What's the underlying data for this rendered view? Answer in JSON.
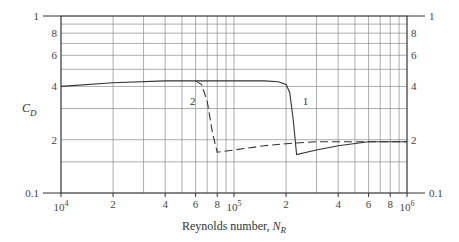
{
  "chart_data": {
    "type": "line",
    "title": "",
    "xlabel": "Reynolds number, N_R",
    "xlabel_main": "Reynolds number, ",
    "xlabel_symbol": "N",
    "xlabel_sub": "R",
    "ylabel": "C_D",
    "ylabel_symbol": "C",
    "ylabel_sub": "D",
    "xscale": "log",
    "yscale": "log",
    "xlim": [
      10000,
      1000000
    ],
    "ylim": [
      0.1,
      1
    ],
    "grid": true,
    "x_ticks": [
      {
        "value": 10000,
        "label": "10",
        "exp": "4"
      },
      {
        "value": 20000,
        "label": "2"
      },
      {
        "value": 40000,
        "label": "4"
      },
      {
        "value": 60000,
        "label": "6"
      },
      {
        "value": 80000,
        "label": "8"
      },
      {
        "value": 100000,
        "label": "10",
        "exp": "5"
      },
      {
        "value": 200000,
        "label": "2"
      },
      {
        "value": 400000,
        "label": "4"
      },
      {
        "value": 600000,
        "label": "6"
      },
      {
        "value": 800000,
        "label": "8"
      },
      {
        "value": 1000000,
        "label": "10",
        "exp": "6"
      }
    ],
    "x_grid_minor": [
      30000,
      50000,
      70000,
      90000,
      300000,
      500000,
      700000,
      900000
    ],
    "y_ticks": [
      {
        "value": 1,
        "label": "1"
      },
      {
        "value": 0.8,
        "label": "8"
      },
      {
        "value": 0.6,
        "label": "6"
      },
      {
        "value": 0.4,
        "label": "4"
      },
      {
        "value": 0.2,
        "label": "2"
      },
      {
        "value": 0.1,
        "label": "0.1"
      }
    ],
    "y_grid": [
      1,
      0.9,
      0.8,
      0.7,
      0.6,
      0.5,
      0.4,
      0.3,
      0.2,
      0.15,
      0.1
    ],
    "series": [
      {
        "name": "1",
        "style": "solid",
        "x": [
          10000,
          20000,
          40000,
          60000,
          100000,
          150000,
          180000,
          200000,
          210000,
          220000,
          230000,
          300000,
          400000,
          600000,
          800000,
          1000000
        ],
        "y": [
          0.4,
          0.42,
          0.43,
          0.43,
          0.43,
          0.43,
          0.425,
          0.41,
          0.37,
          0.26,
          0.165,
          0.175,
          0.185,
          0.195,
          0.195,
          0.195
        ]
      },
      {
        "name": "2",
        "style": "dashed",
        "x": [
          60000,
          65000,
          70000,
          75000,
          80000,
          100000,
          150000,
          200000,
          300000,
          400000,
          600000,
          800000,
          1000000
        ],
        "y": [
          0.43,
          0.41,
          0.33,
          0.22,
          0.17,
          0.175,
          0.185,
          0.19,
          0.195,
          0.195,
          0.195,
          0.195,
          0.195
        ]
      }
    ],
    "annotations": [
      {
        "text": "1",
        "near_x": 240000,
        "near_y": 0.33
      },
      {
        "text": "2",
        "near_x": 62000,
        "near_y": 0.33
      }
    ]
  }
}
